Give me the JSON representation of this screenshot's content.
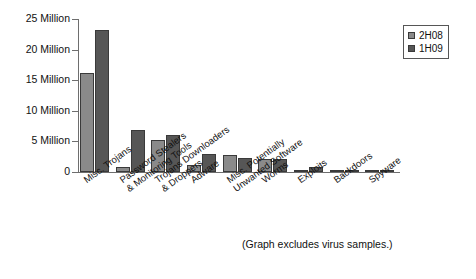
{
  "chart_data": {
    "type": "bar",
    "title": "",
    "xlabel": "",
    "ylabel": "",
    "ylim": [
      0,
      25
    ],
    "grid": false,
    "legend_position": "top-right",
    "units": "Millions of samples",
    "categories": [
      "Misc. Trojans",
      "Password Stealers & Monitoring Tools",
      "Trojans Downloaders & Droppers",
      "Adware",
      "Misc. Potentially Unwanted Software",
      "Worms",
      "Exploits",
      "Backdoors",
      "Spyware"
    ],
    "category_lines": [
      [
        "Misc. Trojans",
        ""
      ],
      [
        "Password Stealers",
        "& Monitoring Tools"
      ],
      [
        "Trojans Downloaders",
        "& Droppers"
      ],
      [
        "Adware",
        ""
      ],
      [
        "Misc. Potentially",
        "Unwanted Software"
      ],
      [
        "Worms",
        ""
      ],
      [
        "Exploits",
        ""
      ],
      [
        "Backdoors",
        ""
      ],
      [
        "Spyware",
        ""
      ]
    ],
    "series": [
      {
        "name": "2H08",
        "color": "#8a8a8a",
        "values": [
          16.2,
          0.8,
          5.3,
          1.2,
          2.7,
          2.1,
          0.4,
          0.3,
          0.15
        ]
      },
      {
        "name": "1H09",
        "color": "#565656",
        "values": [
          23.2,
          6.9,
          6.0,
          2.9,
          2.3,
          2.2,
          0.9,
          0.3,
          0.05
        ]
      }
    ],
    "yticks": [
      0,
      5,
      10,
      15,
      20,
      25
    ],
    "ytick_labels": [
      "0",
      "5 Million",
      "10 Million",
      "15 Million",
      "20 Million",
      "25 Million"
    ]
  },
  "legend": {
    "items": [
      {
        "label": "2H08",
        "color": "#8a8a8a"
      },
      {
        "label": "1H09",
        "color": "#565656"
      }
    ]
  },
  "footnote": "(Graph excludes virus samples.)"
}
